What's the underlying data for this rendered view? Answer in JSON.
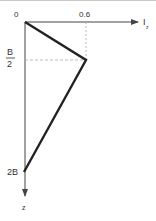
{
  "diagram": {
    "type": "piecewise-linear profile",
    "axes": {
      "horizontal": {
        "label": "I",
        "subscript": "z",
        "tick_label": "0.6"
      },
      "vertical": {
        "label": "z"
      },
      "origin_label": "0"
    },
    "vertical_ticks": [
      {
        "numerator": "B",
        "denominator": "2"
      },
      {
        "label": "2B"
      }
    ],
    "points": [
      {
        "z": "0",
        "Iz": 0
      },
      {
        "z": "B/2",
        "Iz": 0.6
      },
      {
        "z": "2B",
        "Iz": 0
      }
    ],
    "colors": {
      "profile": "#222222",
      "axis": "#444444",
      "dashed": "#999999",
      "text": "#333333"
    }
  }
}
